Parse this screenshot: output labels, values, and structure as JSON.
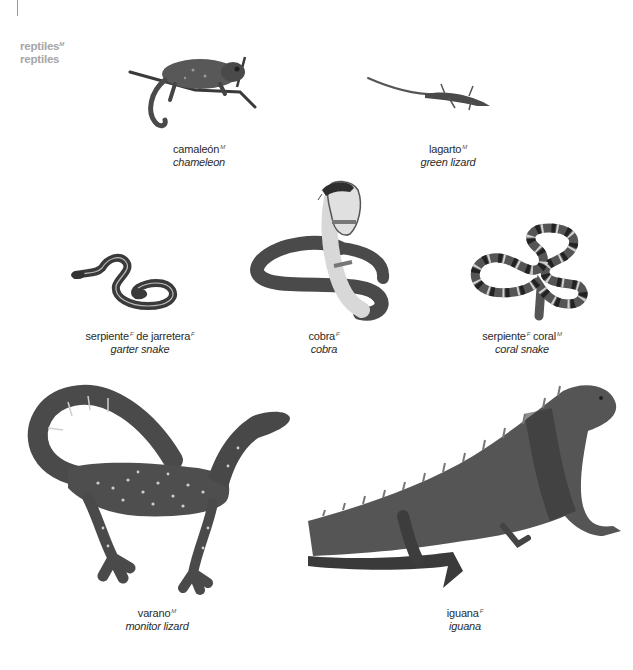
{
  "section": {
    "title_es": "reptiles",
    "title_es_gender": "M",
    "title_en": "reptiles"
  },
  "entries": [
    {
      "id": "chameleon",
      "es": "camaleón",
      "gender": "M",
      "en": "chameleon"
    },
    {
      "id": "green-lizard",
      "es": "lagarto",
      "gender": "M",
      "en": "green lizard"
    },
    {
      "id": "garter-snake",
      "es_parts": [
        {
          "text": "serpiente",
          "gender": "F"
        },
        {
          "text": "de jarretera",
          "gender": "F"
        }
      ],
      "en": "garter snake"
    },
    {
      "id": "cobra",
      "es": "cobra",
      "gender": "F",
      "en": "cobra"
    },
    {
      "id": "coral-snake",
      "es_parts": [
        {
          "text": "serpiente",
          "gender": "F"
        },
        {
          "text": "coral",
          "gender": "M"
        }
      ],
      "en": "coral snake"
    },
    {
      "id": "monitor-lizard",
      "es": "varano",
      "gender": "M",
      "en": "monitor lizard"
    },
    {
      "id": "iguana",
      "es": "iguana",
      "gender": "F",
      "en": "iguana"
    }
  ],
  "colors": {
    "title": "#a6a6a6",
    "text": "#2b2b2b",
    "illustration_dark": "#3a3a3a",
    "illustration_mid": "#6e6e6e",
    "illustration_light": "#c8c8c8"
  }
}
